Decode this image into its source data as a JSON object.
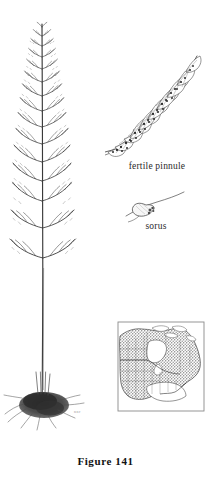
{
  "plate": {
    "caption": "Figure  141",
    "artist_mark": "nnr",
    "background_color": "#ffffff",
    "ink_color": "#2b2b2b"
  },
  "labels": {
    "fertile_pinnule": "fertile pinnule",
    "sorus": "sorus"
  },
  "illustrations": {
    "whole_frond": {
      "name": "whole-frond",
      "description": "tripinnate fern frond with slender stipe and dark fibrous rhizome",
      "pinna_pair_count": 14
    },
    "fertile_pinnule": {
      "name": "fertile-pinnule-detail",
      "description": "enlarged pinnule bearing round sori along the veins",
      "sorus_dot_count": 26
    },
    "sorus": {
      "name": "sorus-detail",
      "description": "single hood-shaped indusium on a vein"
    }
  },
  "map": {
    "name": "distribution-map",
    "region": "North America",
    "shading": "stipple",
    "border_color": "#8a8a8a",
    "land_shade_color": "#9b9b9b",
    "frame": {
      "x": 118,
      "y": 322,
      "w": 86,
      "h": 89
    }
  }
}
